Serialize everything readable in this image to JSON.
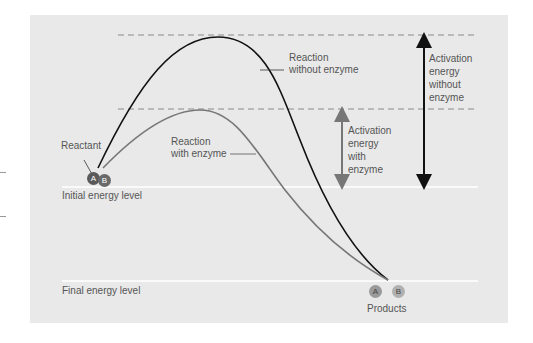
{
  "labels": {
    "reactant": "Reactant",
    "initial_energy": "Initial energy level",
    "final_energy": "Final energy level",
    "products": "Products",
    "without_enzyme": [
      "Reaction",
      "without enzyme"
    ],
    "with_enzyme": [
      "Reaction",
      "with enzyme"
    ],
    "ae_without": [
      "Activation",
      "energy",
      "without",
      "enzyme"
    ],
    "ae_with": [
      "Activation",
      "energy",
      "with",
      "enzyme"
    ]
  },
  "molecules": {
    "reactant_a": "A",
    "reactant_b": "B",
    "product_a": "A",
    "product_b": "B"
  },
  "colors": {
    "panel": "#e9e9e9",
    "no_enzyme_curve": "#111111",
    "enzyme_curve": "#777777",
    "dashed": "#8a8a8a",
    "level_line": "#ffffff",
    "reactant_a": "#5a5a5a",
    "reactant_b": "#6a6a6a",
    "product_a": "#9a9a9a",
    "product_b": "#b0b0b0"
  }
}
